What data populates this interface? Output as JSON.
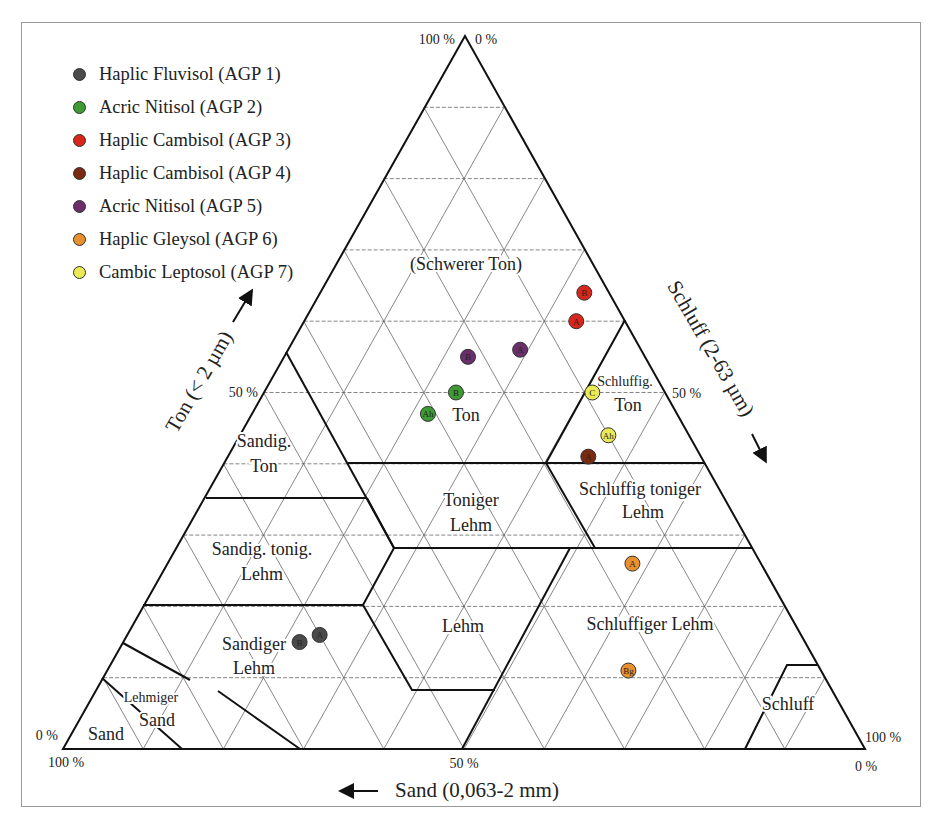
{
  "chart_data": {
    "type": "scatter",
    "subtype": "ternary",
    "title": "",
    "axes": {
      "clay": {
        "label": "Ton (< 2 µm)",
        "ticks": [
          "0 %",
          "50 %",
          "100 %"
        ]
      },
      "silt": {
        "label": "Schluff (2-63 µm)",
        "ticks": [
          "0 %",
          "50 %",
          "100 %"
        ]
      },
      "sand": {
        "label": "Sand (0,063-2 mm)",
        "ticks": [
          "100 %",
          "50 %",
          "0 %"
        ]
      }
    },
    "corner_labels": {
      "apex_left": "100 %",
      "apex_right": "0 %",
      "left_upper": "0 %",
      "left_lower": "100 %",
      "right_upper": "100 %",
      "right_lower": "0 %",
      "left_mid": "50 %",
      "right_mid": "50 %",
      "bottom_mid": "50 %"
    },
    "grid": {
      "step_percent": 10,
      "on": true
    },
    "legend_position": "top-left",
    "series": [
      {
        "name": "Haplic Fluvisol (AGP 1)",
        "color": "#4a4a4a",
        "points": [
          {
            "label": "B",
            "clay": 15,
            "silt": 22,
            "sand": 63
          },
          {
            "label": "A",
            "clay": 16,
            "silt": 24,
            "sand": 60
          }
        ]
      },
      {
        "name": "Acric Nitisol (AGP 2)",
        "color": "#3f9a35",
        "points": [
          {
            "label": "B",
            "clay": 50,
            "silt": 24,
            "sand": 26
          },
          {
            "label": "Ah",
            "clay": 47,
            "silt": 22,
            "sand": 31
          }
        ]
      },
      {
        "name": "Haplic Cambisol (AGP 3)",
        "color": "#d8261c",
        "points": [
          {
            "label": "B",
            "clay": 64,
            "silt": 33,
            "sand": 3
          },
          {
            "label": "A",
            "clay": 60,
            "silt": 34,
            "sand": 6
          }
        ]
      },
      {
        "name": "Haplic Cambisol (AGP 4)",
        "color": "#7a2a10",
        "points": [
          {
            "label": "A",
            "clay": 41,
            "silt": 45,
            "sand": 14
          }
        ]
      },
      {
        "name": "Acric Nitisol (AGP 5)",
        "color": "#6a2f6a",
        "points": [
          {
            "label": "B",
            "clay": 55,
            "silt": 23,
            "sand": 22
          },
          {
            "label": "A",
            "clay": 56,
            "silt": 29,
            "sand": 15
          }
        ]
      },
      {
        "name": "Haplic Gleysol (AGP 6)",
        "color": "#e8902f",
        "points": [
          {
            "label": "A",
            "clay": 26,
            "silt": 58,
            "sand": 16
          },
          {
            "label": "Bg",
            "clay": 11,
            "silt": 65,
            "sand": 24
          }
        ]
      },
      {
        "name": "Cambic Leptosol (AGP 7)",
        "color": "#eaea55",
        "points": [
          {
            "label": "C",
            "clay": 50,
            "silt": 41,
            "sand": 9
          },
          {
            "label": "Ah",
            "clay": 44,
            "silt": 46,
            "sand": 10
          }
        ]
      }
    ],
    "regions": [
      {
        "name": "(Schwerer Ton)",
        "x": 466,
        "y": 270,
        "size": 18
      },
      {
        "name": "Ton",
        "x": 466,
        "y": 421,
        "size": 18
      },
      {
        "name": "Schluffig.",
        "x": 625,
        "y": 386,
        "size": 14
      },
      {
        "name": "Ton",
        "x": 628,
        "y": 411,
        "size": 18
      },
      {
        "name": "Sandig.",
        "x": 264,
        "y": 447,
        "size": 18
      },
      {
        "name": "Ton",
        "x": 264,
        "y": 472,
        "size": 18
      },
      {
        "name": "Toniger",
        "x": 471,
        "y": 506,
        "size": 18
      },
      {
        "name": "Lehm",
        "x": 471,
        "y": 531,
        "size": 18
      },
      {
        "name": "Schluffig toniger",
        "x": 640,
        "y": 495,
        "size": 18
      },
      {
        "name": "Lehm",
        "x": 643,
        "y": 518,
        "size": 18
      },
      {
        "name": "Sandig. tonig.",
        "x": 262,
        "y": 555,
        "size": 18
      },
      {
        "name": "Lehm",
        "x": 262,
        "y": 580,
        "size": 18
      },
      {
        "name": "Lehm",
        "x": 463,
        "y": 632,
        "size": 18
      },
      {
        "name": "Schluffiger Lehm",
        "x": 650,
        "y": 630,
        "size": 18
      },
      {
        "name": "Sandiger",
        "x": 254,
        "y": 650,
        "size": 18
      },
      {
        "name": "Lehm",
        "x": 254,
        "y": 674,
        "size": 18
      },
      {
        "name": "Lehmiger",
        "x": 151,
        "y": 702,
        "size": 14
      },
      {
        "name": "Sand",
        "x": 157,
        "y": 726,
        "size": 18
      },
      {
        "name": "Sand",
        "x": 106,
        "y": 740,
        "size": 18
      },
      {
        "name": "Schluff",
        "x": 788,
        "y": 710,
        "size": 18
      }
    ],
    "boundaries": [
      [
        [
          286,
          352
        ],
        [
          394,
          548
        ]
      ],
      [
        [
          348,
          463
        ],
        [
          705,
          463
        ]
      ],
      [
        [
          206,
          498
        ],
        [
          367,
          498
        ]
      ],
      [
        [
          367,
          498
        ],
        [
          394,
          548
        ],
        [
          363,
          605
        ]
      ],
      [
        [
          394,
          548
        ],
        [
          752,
          548
        ]
      ],
      [
        [
          143,
          605
        ],
        [
          363,
          605
        ]
      ],
      [
        [
          363,
          605
        ],
        [
          412,
          690
        ],
        [
          495,
          690
        ]
      ],
      [
        [
          570,
          548
        ],
        [
          462,
          749
        ]
      ],
      [
        [
          625,
          320
        ],
        [
          546,
          463
        ],
        [
          595,
          548
        ]
      ],
      [
        [
          123,
          643
        ],
        [
          190,
          680
        ]
      ],
      [
        [
          102,
          678
        ],
        [
          182,
          749
        ]
      ],
      [
        [
          218,
          691
        ],
        [
          300,
          749
        ]
      ],
      [
        [
          745,
          749
        ],
        [
          787,
          665
        ],
        [
          817,
          665
        ]
      ]
    ]
  },
  "legend": {
    "items": [
      {
        "label": "Haplic Fluvisol (AGP 1)",
        "color": "#4a4a4a"
      },
      {
        "label": "Acric Nitisol (AGP 2)",
        "color": "#3f9a35"
      },
      {
        "label": "Haplic Cambisol (AGP 3)",
        "color": "#d8261c"
      },
      {
        "label": "Haplic Cambisol (AGP 4)",
        "color": "#7a2a10"
      },
      {
        "label": "Acric Nitisol (AGP 5)",
        "color": "#6a2f6a"
      },
      {
        "label": "Haplic Gleysol (AGP 6)",
        "color": "#e8902f"
      },
      {
        "label": "Cambic Leptosol (AGP 7)",
        "color": "#eaea55"
      }
    ]
  }
}
